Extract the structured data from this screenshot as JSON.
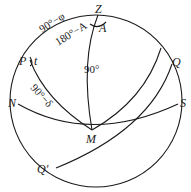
{
  "diagram": {
    "type": "celestial-sphere-astronomical-triangle",
    "points": {
      "Z": "Z",
      "A": "A",
      "P": "P",
      "t": "t",
      "N": "N",
      "S": "S",
      "Q": "Q",
      "M": "M",
      "Q_prime": "Q'"
    },
    "arc_labels": {
      "PZ": "90°−φ",
      "ZM": "90°",
      "PM": "90°−δ",
      "angle_Z_outer": "180°−A"
    }
  }
}
